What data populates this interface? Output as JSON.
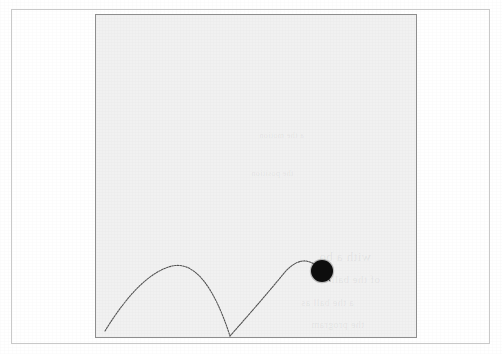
{
  "figure": {
    "kind": "bouncing-ball-trajectory-diagram",
    "medium": "photocopied-book-page",
    "caption": "",
    "page_background": "#ffffff",
    "outer_border_color": "#c9c9c9",
    "frame": {
      "border_color": "#8e8e8e",
      "fill_color": "#f1f1f1",
      "x": 95,
      "y": 14,
      "width": 322,
      "height": 324
    },
    "trajectory": {
      "label": "",
      "stroke_color": "#4a4a4a",
      "stroke_width": 1.1,
      "style": "dotted-photocopy",
      "ground_y": 336,
      "arcs": [
        {
          "name": "arc-1",
          "start_x": 105,
          "start_y": 331,
          "apex_x": 172,
          "apex_y": 266,
          "end_x": 230,
          "end_y": 336
        },
        {
          "name": "arc-2",
          "start_x": 230,
          "start_y": 336,
          "apex_x": 303,
          "apex_y": 262,
          "end_x": 340,
          "end_y": 290
        }
      ]
    },
    "ball": {
      "label": "",
      "color": "#0d0d0d",
      "center_x": 322,
      "center_y": 271,
      "radius": 11
    },
    "showthrough_lines": [
      {
        "text": "with a bo",
        "x": 318,
        "y": 248,
        "size": 13
      },
      {
        "text": "of the ball",
        "x": 330,
        "y": 272,
        "size": 11
      },
      {
        "text": "a the ball as",
        "x": 300,
        "y": 296,
        "size": 10
      },
      {
        "text": "the program",
        "x": 310,
        "y": 318,
        "size": 10
      },
      {
        "text": "a the motion",
        "x": 258,
        "y": 130,
        "size": 8
      },
      {
        "text": "the position",
        "x": 250,
        "y": 168,
        "size": 8
      }
    ]
  }
}
